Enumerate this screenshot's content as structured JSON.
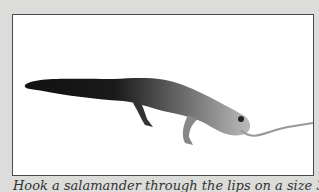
{
  "figure": {
    "illustration": "salamander-hooked-through-lips",
    "caption": "Hook a salamander through the lips on a size 3"
  }
}
